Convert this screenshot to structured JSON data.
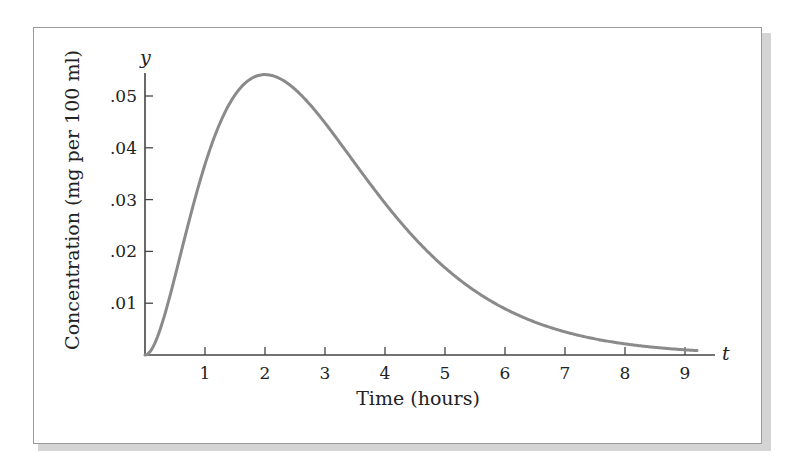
{
  "chart_data": {
    "type": "line",
    "title": "",
    "xlabel": "Time (hours)",
    "ylabel": "Concentration (mg per 100 ml)",
    "x_axis_var": "t",
    "y_axis_var": "y",
    "x_ticks": [
      1,
      2,
      3,
      4,
      5,
      6,
      7,
      8,
      9
    ],
    "x_tick_labels": [
      "1",
      "2",
      "3",
      "4",
      "5",
      "6",
      "7",
      "8",
      "9"
    ],
    "y_ticks": [
      0.01,
      0.02,
      0.03,
      0.04,
      0.05
    ],
    "y_tick_labels": [
      ".01",
      ".02",
      ".03",
      ".04",
      ".05"
    ],
    "xlim": [
      0,
      9.5
    ],
    "ylim": [
      0,
      0.055
    ],
    "grid": false,
    "legend": null,
    "series": [
      {
        "name": "concentration",
        "color": "#8a8a8a",
        "x": [
          0,
          0.25,
          0.5,
          0.75,
          1,
          1.25,
          1.5,
          1.75,
          2,
          2.5,
          3,
          3.5,
          4,
          4.5,
          5,
          5.5,
          6,
          6.5,
          7,
          7.5,
          8,
          8.5,
          9,
          9.2
        ],
        "values": [
          0,
          0.0049,
          0.0152,
          0.0266,
          0.0368,
          0.0448,
          0.0502,
          0.0532,
          0.0541,
          0.0513,
          0.0448,
          0.037,
          0.0293,
          0.0225,
          0.0168,
          0.0123,
          0.0089,
          0.0064,
          0.0045,
          0.0031,
          0.0021,
          0.0015,
          0.001,
          0.0009
        ]
      }
    ]
  }
}
